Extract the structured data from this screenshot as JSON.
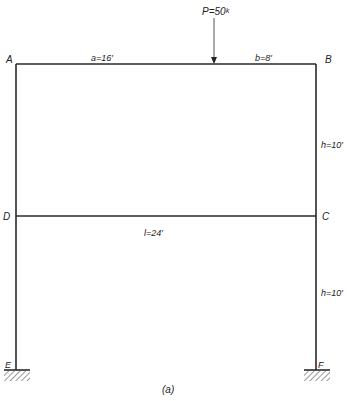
{
  "diagram": {
    "caption": "(a)",
    "colors": {
      "line": "#2a2a2a",
      "hatch": "#555555",
      "text": "#222222"
    },
    "nodes": {
      "A": {
        "label": "A",
        "x": 16,
        "y": 64
      },
      "B": {
        "label": "B",
        "x": 316,
        "y": 64
      },
      "C": {
        "label": "C",
        "x": 316,
        "y": 216
      },
      "D": {
        "label": "D",
        "x": 16,
        "y": 216
      },
      "E": {
        "label": "E",
        "x": 16,
        "y": 370
      },
      "F": {
        "label": "F",
        "x": 316,
        "y": 370
      }
    },
    "members": [
      {
        "name": "top-beam",
        "from": "A",
        "to": "B"
      },
      {
        "name": "middle-beam",
        "from": "D",
        "to": "C"
      },
      {
        "name": "left-column",
        "from": "A",
        "to": "E"
      },
      {
        "name": "right-column",
        "from": "B",
        "to": "F"
      }
    ],
    "supports": [
      {
        "node": "E",
        "type": "fixed"
      },
      {
        "node": "F",
        "type": "fixed"
      }
    ],
    "load": {
      "label": "P=50ᵏ",
      "value": "50",
      "unit": "k",
      "x": 214
    },
    "dimensions": {
      "a": "a=16′",
      "b": "b=8′",
      "l": "l=24′",
      "h_upper": "h=10′",
      "h_lower": "h=10′"
    }
  }
}
